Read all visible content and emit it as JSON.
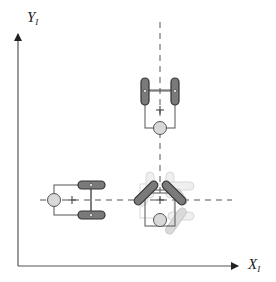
{
  "diagram": {
    "type": "mobile-robot-configurations",
    "axes": {
      "y_label": "Y",
      "y_subscript": "I",
      "x_label": "X",
      "x_subscript": "I"
    },
    "robots": [
      {
        "name": "robot-top",
        "orientation": "vertical (caster below)",
        "style": "solid"
      },
      {
        "name": "robot-left",
        "orientation": "horizontal (caster left)",
        "style": "solid"
      },
      {
        "name": "robot-bottom-right",
        "orientation": "rotated (45deg wheels)",
        "style": "solid with faded ghost poses"
      }
    ],
    "colors": {
      "axis": "#444444",
      "wheel_fill": "#7a7a7a",
      "wheel_stroke": "#333333",
      "frame": "#555555",
      "caster_fill": "#d9d9d9",
      "ghost": "#c8c8c8",
      "dash": "#555555"
    }
  }
}
